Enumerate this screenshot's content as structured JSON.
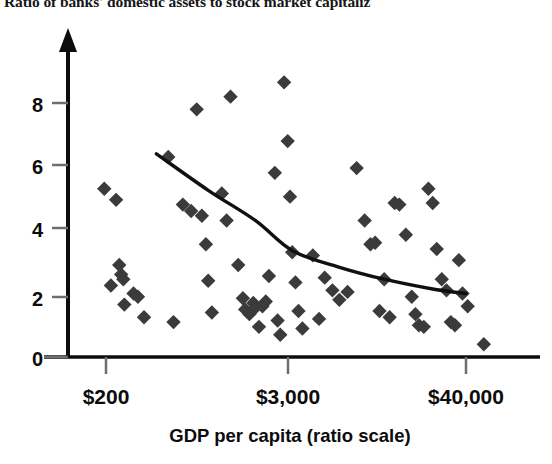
{
  "chart_data": {
    "type": "scatter",
    "title": "Ratio of banks' domestic assets to stock market capitaliz",
    "title_truncated": true,
    "xlabel": "GDP per capita (ratio scale)",
    "ylabel": "",
    "xscale": "log",
    "yscale": "linear",
    "grid": false,
    "legend": false,
    "xtick_labels": [
      "$200",
      "$3,000",
      "$40,000"
    ],
    "xtick_values": [
      200,
      3000,
      40000
    ],
    "ytick_labels": [
      "0",
      "2",
      "4",
      "6",
      "8"
    ],
    "ytick_values": [
      0,
      2,
      4,
      6,
      8
    ],
    "ylim": [
      0,
      9.3
    ],
    "xlim": [
      130,
      75000
    ],
    "marker": "diamond",
    "marker_color": "#3b3b3b",
    "points": [
      {
        "x": 195,
        "y": 5.3
      },
      {
        "x": 215,
        "y": 2.25
      },
      {
        "x": 232,
        "y": 4.95
      },
      {
        "x": 243,
        "y": 2.9
      },
      {
        "x": 250,
        "y": 2.6
      },
      {
        "x": 258,
        "y": 2.45
      },
      {
        "x": 262,
        "y": 1.65
      },
      {
        "x": 300,
        "y": 2.0
      },
      {
        "x": 320,
        "y": 1.9
      },
      {
        "x": 350,
        "y": 1.25
      },
      {
        "x": 500,
        "y": 6.3
      },
      {
        "x": 540,
        "y": 1.1
      },
      {
        "x": 620,
        "y": 4.8
      },
      {
        "x": 700,
        "y": 4.6
      },
      {
        "x": 760,
        "y": 7.8
      },
      {
        "x": 820,
        "y": 4.45
      },
      {
        "x": 870,
        "y": 3.55
      },
      {
        "x": 900,
        "y": 2.4
      },
      {
        "x": 950,
        "y": 1.4
      },
      {
        "x": 1100,
        "y": 5.15
      },
      {
        "x": 1180,
        "y": 4.3
      },
      {
        "x": 1250,
        "y": 8.2
      },
      {
        "x": 1400,
        "y": 2.9
      },
      {
        "x": 1500,
        "y": 1.85
      },
      {
        "x": 1550,
        "y": 1.5
      },
      {
        "x": 1650,
        "y": 1.35
      },
      {
        "x": 1750,
        "y": 1.7
      },
      {
        "x": 1800,
        "y": 1.55
      },
      {
        "x": 1900,
        "y": 0.95
      },
      {
        "x": 2000,
        "y": 1.6
      },
      {
        "x": 2100,
        "y": 1.75
      },
      {
        "x": 2200,
        "y": 2.55
      },
      {
        "x": 2400,
        "y": 5.8
      },
      {
        "x": 2500,
        "y": 1.15
      },
      {
        "x": 2600,
        "y": 0.7
      },
      {
        "x": 2750,
        "y": 8.65
      },
      {
        "x": 2900,
        "y": 6.8
      },
      {
        "x": 3000,
        "y": 5.05
      },
      {
        "x": 3100,
        "y": 3.3
      },
      {
        "x": 3250,
        "y": 2.35
      },
      {
        "x": 3400,
        "y": 1.45
      },
      {
        "x": 3600,
        "y": 0.9
      },
      {
        "x": 4200,
        "y": 3.2
      },
      {
        "x": 4600,
        "y": 1.2
      },
      {
        "x": 5000,
        "y": 2.5
      },
      {
        "x": 5600,
        "y": 2.1
      },
      {
        "x": 6200,
        "y": 1.8
      },
      {
        "x": 7000,
        "y": 2.05
      },
      {
        "x": 8000,
        "y": 5.95
      },
      {
        "x": 9000,
        "y": 4.3
      },
      {
        "x": 9800,
        "y": 3.55
      },
      {
        "x": 10500,
        "y": 3.6
      },
      {
        "x": 11200,
        "y": 1.45
      },
      {
        "x": 12000,
        "y": 2.45
      },
      {
        "x": 13000,
        "y": 1.25
      },
      {
        "x": 14000,
        "y": 4.85
      },
      {
        "x": 15000,
        "y": 4.8
      },
      {
        "x": 16500,
        "y": 3.85
      },
      {
        "x": 18000,
        "y": 1.9
      },
      {
        "x": 19000,
        "y": 1.35
      },
      {
        "x": 20000,
        "y": 1.0
      },
      {
        "x": 21500,
        "y": 0.95
      },
      {
        "x": 23000,
        "y": 5.3
      },
      {
        "x": 24500,
        "y": 4.85
      },
      {
        "x": 26000,
        "y": 3.4
      },
      {
        "x": 28000,
        "y": 2.45
      },
      {
        "x": 30000,
        "y": 2.1
      },
      {
        "x": 32000,
        "y": 1.1
      },
      {
        "x": 34000,
        "y": 1.0
      },
      {
        "x": 36000,
        "y": 3.05
      },
      {
        "x": 38000,
        "y": 2.0
      },
      {
        "x": 41000,
        "y": 1.6
      },
      {
        "x": 52000,
        "y": 0.4
      }
    ],
    "trend_line": {
      "label": "fitted curve",
      "color": "#101010",
      "points": [
        {
          "x": 420,
          "y": 6.4
        },
        {
          "x": 900,
          "y": 5.25
        },
        {
          "x": 1800,
          "y": 4.3
        },
        {
          "x": 3100,
          "y": 3.35
        },
        {
          "x": 6000,
          "y": 2.85
        },
        {
          "x": 12000,
          "y": 2.45
        },
        {
          "x": 24000,
          "y": 2.15
        },
        {
          "x": 40000,
          "y": 2.0
        }
      ]
    }
  }
}
